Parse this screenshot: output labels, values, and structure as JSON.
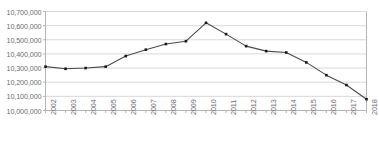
{
  "chart_data": {
    "type": "line",
    "title": "",
    "subtitle": "",
    "xlabel": "",
    "ylabel": "",
    "categories": [
      "2002",
      "2003",
      "2004",
      "2005",
      "2006",
      "2007",
      "2008",
      "2009",
      "2010",
      "2011",
      "2012",
      "2013",
      "2014",
      "2015",
      "2016",
      "2017",
      "2018"
    ],
    "values": [
      10310000,
      10295000,
      10300000,
      10310000,
      10385000,
      10430000,
      10470000,
      10490000,
      10620000,
      10540000,
      10455000,
      10420000,
      10410000,
      10340000,
      10250000,
      10180000,
      10080000
    ],
    "series": [
      {
        "name": "Population",
        "values": [
          10310000,
          10295000,
          10300000,
          10310000,
          10385000,
          10430000,
          10470000,
          10490000,
          10620000,
          10540000,
          10455000,
          10420000,
          10410000,
          10340000,
          10250000,
          10180000,
          10080000
        ]
      }
    ],
    "ylim": [
      10000000,
      10700000
    ],
    "ytick_values": [
      10700000,
      10600000,
      10500000,
      10400000,
      10300000,
      10200000,
      10100000,
      10000000
    ],
    "ytick_labels": [
      "10,700,000",
      "10,600,000",
      "10,500,000",
      "10,400,000",
      "10,300,000",
      "10,200,000",
      "10,100,000",
      "10,000,000"
    ],
    "grid": true,
    "grid_axis": "y",
    "legend": false,
    "legend_position": "none",
    "marker": "square",
    "line_color": "#4a4a4a",
    "marker_color": "#1a1a1a",
    "grid_color": "#d9d9d9",
    "axis_color": "#b4b4b4",
    "tick_label_color": "#6e6e6e",
    "background_color": "#ffffff"
  }
}
